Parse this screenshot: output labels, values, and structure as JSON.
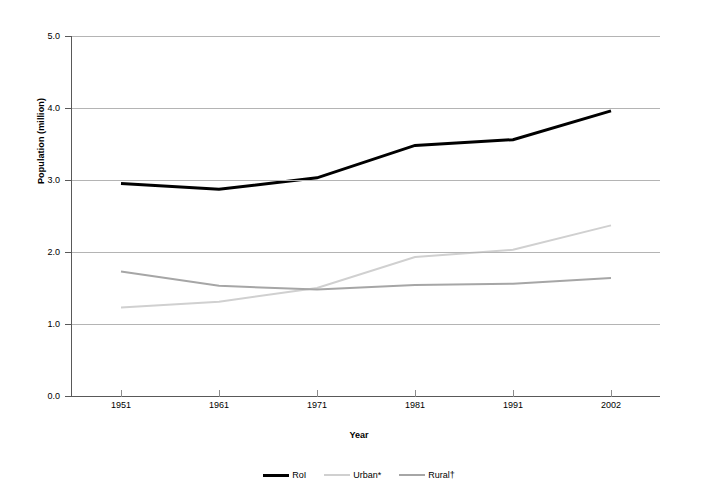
{
  "chart_data": {
    "type": "line",
    "title": "",
    "xlabel": "Year",
    "ylabel": "Population (million)",
    "categories": [
      "1951",
      "1961",
      "1971",
      "1981",
      "1991",
      "2002"
    ],
    "x": [
      1951,
      1961,
      1971,
      1981,
      1991,
      2002
    ],
    "ylim": [
      0.0,
      5.0
    ],
    "ytick_labels": [
      "0.0",
      "1.0",
      "2.0",
      "3.0",
      "4.0",
      "5.0"
    ],
    "ytick_values": [
      0.0,
      1.0,
      2.0,
      3.0,
      4.0,
      5.0
    ],
    "grid": true,
    "legend_position": "bottom",
    "series": [
      {
        "name": "RoI",
        "color": "#000000",
        "width": 3,
        "values": [
          2.95,
          2.87,
          3.03,
          3.48,
          3.56,
          3.96
        ]
      },
      {
        "name": "Urban*",
        "color": "#d0d0d0",
        "width": 2,
        "values": [
          1.23,
          1.31,
          1.5,
          1.93,
          2.03,
          2.37
        ]
      },
      {
        "name": "Rural†",
        "color": "#a6a6a6",
        "width": 2,
        "values": [
          1.73,
          1.53,
          1.48,
          1.54,
          1.56,
          1.64
        ]
      }
    ]
  },
  "axes": {
    "y_title": "Population (million)",
    "x_title": "Year"
  },
  "colors": {
    "gridline": "#b4b4b4",
    "axis": "#595959",
    "background": "#ffffff"
  }
}
